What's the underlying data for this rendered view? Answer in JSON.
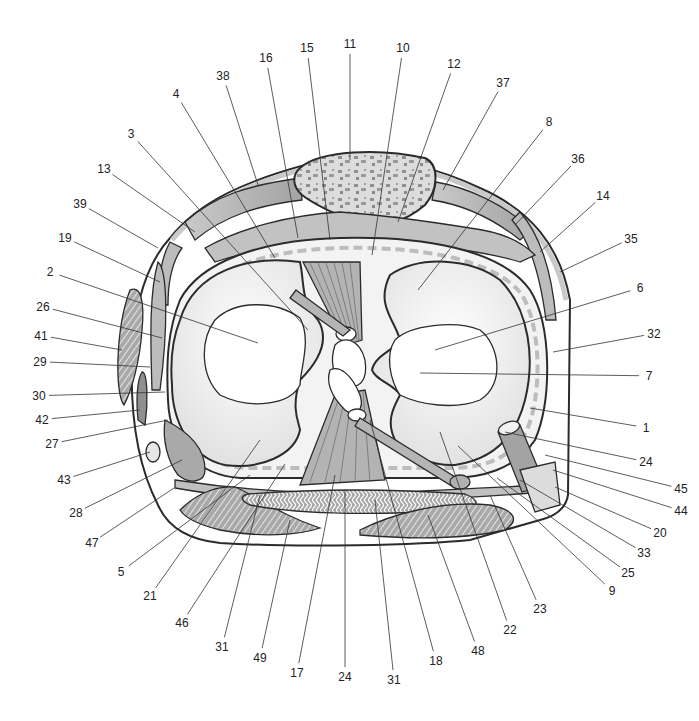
{
  "diagram": {
    "colors": {
      "outline": "#2b2b2b",
      "tissue_gray": "#b8b8b8",
      "dark_gray": "#999999",
      "light_fill": "#ececec",
      "bone_speckle": "#8f8f8f",
      "dashed_capsule": "#bdbdbd",
      "background": "#ffffff"
    },
    "labels": [
      {
        "id": "11",
        "x": 350,
        "y": 48,
        "to": [
          350,
          160
        ]
      },
      {
        "id": "15",
        "x": 307,
        "y": 52,
        "to": [
          330,
          240
        ]
      },
      {
        "id": "10",
        "x": 403,
        "y": 52,
        "to": [
          372,
          255
        ]
      },
      {
        "id": "16",
        "x": 266,
        "y": 62,
        "to": [
          298,
          238
        ]
      },
      {
        "id": "12",
        "x": 454,
        "y": 68,
        "to": [
          398,
          222
        ]
      },
      {
        "id": "38",
        "x": 223,
        "y": 80,
        "to": [
          258,
          185
        ]
      },
      {
        "id": "37",
        "x": 503,
        "y": 87,
        "to": [
          443,
          190
        ]
      },
      {
        "id": "4",
        "x": 176,
        "y": 98,
        "to": [
          275,
          258
        ]
      },
      {
        "id": "8",
        "x": 549,
        "y": 126,
        "to": [
          418,
          290
        ]
      },
      {
        "id": "3",
        "x": 131,
        "y": 138,
        "to": [
          308,
          330
        ]
      },
      {
        "id": "36",
        "x": 578,
        "y": 163,
        "to": [
          515,
          225
        ]
      },
      {
        "id": "13",
        "x": 104,
        "y": 173,
        "to": [
          195,
          232
        ]
      },
      {
        "id": "14",
        "x": 603,
        "y": 200,
        "to": [
          540,
          252
        ]
      },
      {
        "id": "39",
        "x": 80,
        "y": 208,
        "to": [
          158,
          248
        ]
      },
      {
        "id": "19",
        "x": 65,
        "y": 242,
        "to": [
          160,
          282
        ]
      },
      {
        "id": "35",
        "x": 631,
        "y": 243,
        "to": [
          560,
          272
        ]
      },
      {
        "id": "2",
        "x": 50,
        "y": 276,
        "to": [
          258,
          343
        ]
      },
      {
        "id": "6",
        "x": 640,
        "y": 292,
        "to": [
          435,
          350
        ]
      },
      {
        "id": "26",
        "x": 43,
        "y": 311,
        "to": [
          162,
          338
        ]
      },
      {
        "id": "41",
        "x": 41,
        "y": 340,
        "to": [
          122,
          350
        ]
      },
      {
        "id": "32",
        "x": 654,
        "y": 338,
        "to": [
          553,
          352
        ]
      },
      {
        "id": "29",
        "x": 40,
        "y": 366,
        "to": [
          150,
          367
        ]
      },
      {
        "id": "7",
        "x": 649,
        "y": 380,
        "to": [
          420,
          373
        ]
      },
      {
        "id": "30",
        "x": 39,
        "y": 400,
        "to": [
          165,
          392
        ]
      },
      {
        "id": "42",
        "x": 42,
        "y": 424,
        "to": [
          140,
          410
        ]
      },
      {
        "id": "1",
        "x": 646,
        "y": 432,
        "to": [
          530,
          408
        ]
      },
      {
        "id": "27",
        "x": 52,
        "y": 448,
        "to": [
          168,
          420
        ]
      },
      {
        "id": "24",
        "x": 646,
        "y": 466,
        "to": [
          505,
          432
        ]
      },
      {
        "id": "43",
        "x": 64,
        "y": 484,
        "to": [
          150,
          452
        ]
      },
      {
        "id": "45",
        "x": 681,
        "y": 493,
        "to": [
          545,
          455
        ]
      },
      {
        "id": "44",
        "x": 681,
        "y": 515,
        "to": [
          553,
          470
        ]
      },
      {
        "id": "28",
        "x": 76,
        "y": 517,
        "to": [
          182,
          460
        ]
      },
      {
        "id": "20",
        "x": 660,
        "y": 537,
        "to": [
          555,
          487
        ]
      },
      {
        "id": "47",
        "x": 92,
        "y": 547,
        "to": [
          174,
          488
        ]
      },
      {
        "id": "33",
        "x": 644,
        "y": 557,
        "to": [
          520,
          480
        ]
      },
      {
        "id": "25",
        "x": 628,
        "y": 577,
        "to": [
          497,
          478
        ]
      },
      {
        "id": "5",
        "x": 121,
        "y": 576,
        "to": [
          250,
          475
        ]
      },
      {
        "id": "9",
        "x": 612,
        "y": 595,
        "to": [
          458,
          446
        ]
      },
      {
        "id": "21",
        "x": 150,
        "y": 600,
        "to": [
          260,
          440
        ]
      },
      {
        "id": "23",
        "x": 540,
        "y": 613,
        "to": [
          490,
          495
        ]
      },
      {
        "id": "46",
        "x": 182,
        "y": 627,
        "to": [
          285,
          464
        ]
      },
      {
        "id": "22",
        "x": 510,
        "y": 634,
        "to": [
          440,
          432
        ]
      },
      {
        "id": "31",
        "x": 222,
        "y": 651,
        "to": [
          260,
          495
        ]
      },
      {
        "id": "49",
        "x": 260,
        "y": 662,
        "to": [
          290,
          520
        ]
      },
      {
        "id": "48",
        "x": 478,
        "y": 655,
        "to": [
          428,
          515
        ]
      },
      {
        "id": "17",
        "x": 297,
        "y": 677,
        "to": [
          335,
          475
        ]
      },
      {
        "id": "18",
        "x": 436,
        "y": 665,
        "to": [
          370,
          420
        ]
      },
      {
        "id": "24b",
        "text": "24",
        "x": 345,
        "y": 681,
        "to": [
          345,
          490
        ]
      },
      {
        "id": "31b",
        "text": "31",
        "x": 394,
        "y": 684,
        "to": [
          375,
          500
        ]
      }
    ]
  }
}
